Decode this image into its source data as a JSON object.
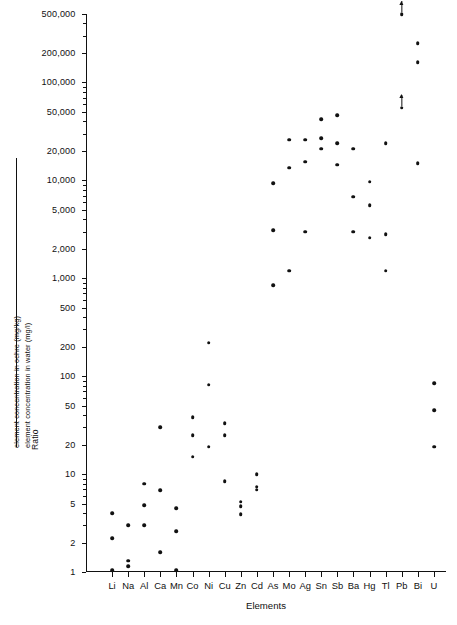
{
  "chart_data": {
    "type": "scatter",
    "title": "",
    "xlabel": "Elements",
    "ylabel_prefix": "Ratio",
    "ylabel_numerator": "element concentration in ochre (mg/kg)",
    "ylabel_denominator": "element concentration in water (mg/l)",
    "yscale": "log",
    "ylim": [
      1,
      500000
    ],
    "grid": false,
    "legend": null,
    "ytick_labels": [
      "500,000",
      "200,000",
      "100,000",
      "50,000",
      "20,000",
      "10,000",
      "5,000",
      "2,000",
      "1,000",
      "500",
      "200",
      "100",
      "50",
      "20",
      "10",
      "5",
      "2",
      "1"
    ],
    "ytick_values": [
      500000,
      200000,
      100000,
      50000,
      20000,
      10000,
      5000,
      2000,
      1000,
      500,
      200,
      100,
      50,
      20,
      10,
      5,
      2,
      1
    ],
    "categories": [
      "Li",
      "Na",
      "Al",
      "Ca",
      "Mn",
      "Co",
      "Ni",
      "Cu",
      "Zn",
      "Cd",
      "As",
      "Mo",
      "Ag",
      "Sn",
      "Sb",
      "Ba",
      "Hg",
      "Tl",
      "Pb",
      "Bi",
      "U"
    ],
    "series": [
      {
        "name": "ochre/water ratio",
        "points": [
          {
            "category": "Li",
            "values": [
              4.0,
              2.2,
              1.05
            ]
          },
          {
            "category": "Na",
            "values": [
              3.0,
              1.3,
              1.15
            ]
          },
          {
            "category": "Al",
            "values": [
              8.0,
              4.8,
              3.0
            ]
          },
          {
            "category": "Ca",
            "values": [
              30.0,
              6.8,
              1.6
            ]
          },
          {
            "category": "Mn",
            "values": [
              4.5,
              2.6,
              1.05
            ]
          },
          {
            "category": "Co",
            "values": [
              38.0,
              25.0,
              15.0
            ]
          },
          {
            "category": "Ni",
            "values": [
              220.0,
              82.0,
              19.0
            ]
          },
          {
            "category": "Cu",
            "values": [
              33.0,
              25.0,
              8.5
            ]
          },
          {
            "category": "Zn",
            "values": [
              5.2,
              4.7,
              3.9
            ]
          },
          {
            "category": "Cd",
            "values": [
              10.0,
              7.4,
              6.9
            ]
          },
          {
            "category": "As",
            "values": [
              9400.0,
              3100.0,
              850.0
            ]
          },
          {
            "category": "Mo",
            "values": [
              26000.0,
              13500.0,
              1200.0
            ]
          },
          {
            "category": "Ag",
            "values": [
              26000.0,
              15500.0,
              3000.0
            ]
          },
          {
            "category": "Sn",
            "values": [
              42000.0,
              27000.0,
              21000.0
            ]
          },
          {
            "category": "Sb",
            "values": [
              46000.0,
              24000.0,
              14500.0
            ]
          },
          {
            "category": "Ba",
            "values": [
              21000.0,
              6800.0,
              3000.0
            ]
          },
          {
            "category": "Hg",
            "values": [
              9700.0,
              5600.0,
              2600.0
            ]
          },
          {
            "category": "Tl",
            "values": [
              24000.0,
              2800.0,
              1200.0
            ]
          },
          {
            "category": "Pb",
            "values": [
              500000.0,
              55000.0
            ],
            "censored": "above"
          },
          {
            "category": "Bi",
            "values": [
              250000.0,
              160000.0,
              15000.0
            ]
          },
          {
            "category": "U",
            "values": [
              85.0,
              45.0,
              19.0
            ]
          }
        ]
      }
    ]
  }
}
